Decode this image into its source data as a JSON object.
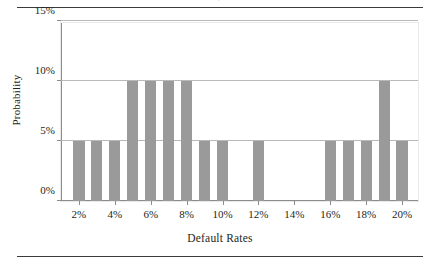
{
  "figure": {
    "clipped_caption_above": "p",
    "rules": {
      "top": true,
      "bottom": true
    }
  },
  "chart_data": {
    "type": "bar",
    "title": "",
    "subtitle": "",
    "xlabel": "Default Rates",
    "ylabel": "Probability",
    "xlim": [
      1,
      21
    ],
    "ylim": [
      0,
      15
    ],
    "grid": "horizontal",
    "legend": "none",
    "bar_color": "#9a9a9a",
    "x_unit": "%",
    "y_unit": "%",
    "x_tick_labels": [
      "2%",
      "4%",
      "6%",
      "8%",
      "10%",
      "12%",
      "14%",
      "16%",
      "18%",
      "20%"
    ],
    "x_tick_values": [
      2,
      4,
      6,
      8,
      10,
      12,
      14,
      16,
      18,
      20
    ],
    "y_tick_labels": [
      "0%",
      "5%",
      "10%",
      "15%"
    ],
    "y_tick_values": [
      0,
      5,
      10,
      15
    ],
    "categories": [
      2,
      3,
      4,
      5,
      6,
      7,
      8,
      9,
      10,
      11,
      12,
      13,
      14,
      15,
      16,
      17,
      18,
      19,
      20
    ],
    "values": [
      5,
      5,
      5,
      10,
      10,
      10,
      10,
      5,
      5,
      0,
      5,
      0,
      0,
      0,
      5,
      5,
      5,
      10,
      5
    ],
    "bars": [
      {
        "x": 2,
        "value": 5
      },
      {
        "x": 3,
        "value": 5
      },
      {
        "x": 4,
        "value": 5
      },
      {
        "x": 5,
        "value": 10
      },
      {
        "x": 6,
        "value": 10
      },
      {
        "x": 7,
        "value": 10
      },
      {
        "x": 8,
        "value": 10
      },
      {
        "x": 9,
        "value": 5
      },
      {
        "x": 10,
        "value": 5
      },
      {
        "x": 11,
        "value": 0
      },
      {
        "x": 12,
        "value": 5
      },
      {
        "x": 13,
        "value": 0
      },
      {
        "x": 14,
        "value": 0
      },
      {
        "x": 15,
        "value": 0
      },
      {
        "x": 16,
        "value": 5
      },
      {
        "x": 17,
        "value": 5
      },
      {
        "x": 18,
        "value": 5
      },
      {
        "x": 19,
        "value": 10
      },
      {
        "x": 20,
        "value": 5
      }
    ]
  }
}
